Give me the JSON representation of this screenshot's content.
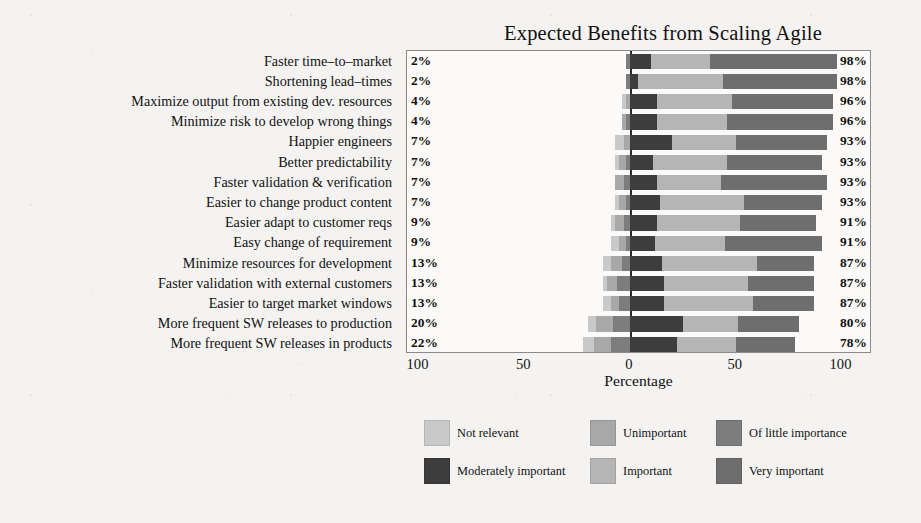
{
  "chart_data": {
    "type": "bar",
    "subtype": "diverging-stacked-likert",
    "title": "Expected Benefits from Scaling Agile",
    "xlabel": "Percentage",
    "ylabel": "",
    "xlim": [
      -100,
      100
    ],
    "xticks": [
      "100",
      "50",
      "0",
      "50",
      "100"
    ],
    "xtick_values": [
      -100,
      -50,
      0,
      50,
      100
    ],
    "grid": false,
    "legend_position": "bottom",
    "legend": [
      "Not relevant",
      "Unimportant",
      "Of little importance",
      "Moderately important",
      "Important",
      "Very important"
    ],
    "series": [
      {
        "name": "Not relevant",
        "color": "#c9c9c9"
      },
      {
        "name": "Unimportant",
        "color": "#a8a8a8"
      },
      {
        "name": "Of little importance",
        "color": "#7d7d7d"
      },
      {
        "name": "Moderately important",
        "color": "#3d3d3d"
      },
      {
        "name": "Important",
        "color": "#b5b5b5"
      },
      {
        "name": "Very important",
        "color": "#6e6e6e"
      }
    ],
    "categories": [
      "Faster time–to–market",
      "Shortening lead–times",
      "Maximize output from existing dev. resources",
      "Minimize risk to develop wrong things",
      "Happier engineers",
      "Better predictability",
      "Faster validation & verification",
      "Easier to change product content",
      "Easier adapt to customer reqs",
      "Easy change of requirement",
      "Minimize resources for development",
      "Faster validation with external customers",
      "Easier to target market windows",
      "More frequent SW releases to production",
      "More frequent SW releases in products"
    ],
    "left_labels": [
      "2%",
      "2%",
      "4%",
      "4%",
      "7%",
      "7%",
      "7%",
      "7%",
      "9%",
      "9%",
      "13%",
      "13%",
      "13%",
      "20%",
      "22%"
    ],
    "right_labels": [
      "98%",
      "98%",
      "96%",
      "96%",
      "93%",
      "93%",
      "93%",
      "93%",
      "91%",
      "91%",
      "87%",
      "87%",
      "87%",
      "80%",
      "78%"
    ],
    "rows": [
      {
        "category": "Faster time–to–market",
        "negative_total": 2,
        "positive_total": 98,
        "values": [
          0,
          0,
          2,
          10,
          28,
          60
        ]
      },
      {
        "category": "Shortening lead–times",
        "negative_total": 2,
        "positive_total": 98,
        "values": [
          0,
          0,
          2,
          4,
          40,
          54
        ]
      },
      {
        "category": "Maximize output from existing dev. resources",
        "negative_total": 4,
        "positive_total": 96,
        "values": [
          2,
          2,
          0,
          13,
          35,
          48
        ]
      },
      {
        "category": "Minimize risk to develop wrong things",
        "negative_total": 4,
        "positive_total": 96,
        "values": [
          0,
          2,
          2,
          13,
          33,
          50
        ]
      },
      {
        "category": "Happier engineers",
        "negative_total": 7,
        "positive_total": 93,
        "values": [
          4,
          3,
          0,
          20,
          30,
          43
        ]
      },
      {
        "category": "Better predictability",
        "negative_total": 7,
        "positive_total": 93,
        "values": [
          2,
          3,
          2,
          11,
          35,
          45
        ]
      },
      {
        "category": "Faster validation & verification",
        "negative_total": 7,
        "positive_total": 93,
        "values": [
          0,
          4,
          3,
          13,
          30,
          50
        ]
      },
      {
        "category": "Easier to change product content",
        "negative_total": 7,
        "positive_total": 93,
        "values": [
          2,
          3,
          2,
          14,
          40,
          37
        ]
      },
      {
        "category": "Easier adapt to customer reqs",
        "negative_total": 9,
        "positive_total": 91,
        "values": [
          2,
          4,
          3,
          13,
          39,
          36
        ]
      },
      {
        "category": "Easy change of requirement",
        "negative_total": 9,
        "positive_total": 91,
        "values": [
          4,
          3,
          2,
          12,
          33,
          46
        ]
      },
      {
        "category": "Minimize resources for development",
        "negative_total": 13,
        "positive_total": 87,
        "values": [
          4,
          5,
          4,
          15,
          45,
          27
        ]
      },
      {
        "category": "Faster validation with external customers",
        "negative_total": 13,
        "positive_total": 87,
        "values": [
          2,
          5,
          6,
          16,
          40,
          31
        ]
      },
      {
        "category": "Easier to target market windows",
        "negative_total": 13,
        "positive_total": 87,
        "values": [
          4,
          4,
          5,
          16,
          42,
          29
        ]
      },
      {
        "category": "More frequent SW releases to production",
        "negative_total": 20,
        "positive_total": 80,
        "values": [
          4,
          8,
          8,
          25,
          26,
          29
        ]
      },
      {
        "category": "More frequent SW releases in products",
        "negative_total": 22,
        "positive_total": 78,
        "values": [
          5,
          8,
          9,
          22,
          28,
          28
        ]
      }
    ]
  }
}
